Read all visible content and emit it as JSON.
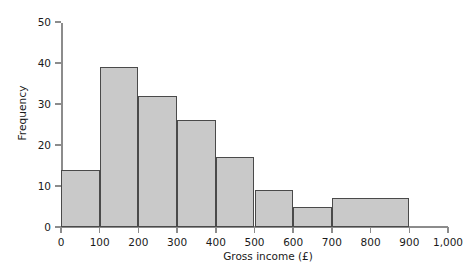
{
  "chart_data": {
    "type": "bar",
    "title": "",
    "subtitle": "",
    "xlabel": "Gross income (£)",
    "ylabel": "Frequency",
    "xlim": [
      0,
      1000
    ],
    "ylim": [
      0,
      55
    ],
    "grid": false,
    "legend": null,
    "x_tick_labels": [
      "0",
      "100",
      "200",
      "300",
      "400",
      "500",
      "600",
      "700",
      "800",
      "900",
      "1,000"
    ],
    "x_tick_values": [
      0,
      100,
      200,
      300,
      400,
      500,
      600,
      700,
      800,
      900,
      1000
    ],
    "y_tick_labels": [
      "0",
      "10",
      "20",
      "30",
      "40",
      "50"
    ],
    "y_tick_values": [
      0,
      10,
      20,
      30,
      40,
      50
    ],
    "bin_edges": [
      0,
      100,
      200,
      300,
      400,
      500,
      600,
      700,
      900
    ],
    "categories": [
      "0-100",
      "100-200",
      "200-300",
      "300-400",
      "400-500",
      "500-600",
      "600-700",
      "700-900"
    ],
    "values": [
      14,
      39,
      32,
      26,
      17,
      9,
      5,
      7
    ],
    "bars": [
      {
        "label": "0-100",
        "start": 0,
        "end": 100,
        "value": 14
      },
      {
        "label": "100-200",
        "start": 100,
        "end": 200,
        "value": 39
      },
      {
        "label": "200-300",
        "start": 200,
        "end": 300,
        "value": 32
      },
      {
        "label": "300-400",
        "start": 300,
        "end": 400,
        "value": 26
      },
      {
        "label": "400-500",
        "start": 400,
        "end": 500,
        "value": 17
      },
      {
        "label": "500-600",
        "start": 500,
        "end": 600,
        "value": 9
      },
      {
        "label": "600-700",
        "start": 600,
        "end": 700,
        "value": 5
      },
      {
        "label": "700-900",
        "start": 700,
        "end": 900,
        "value": 7
      }
    ],
    "colors": {
      "bar_fill": "#c9c9c9",
      "bar_border": "#4a4a4a",
      "axis": "#8c8c8c",
      "text": "#1a1a1a",
      "background": "#ffffff"
    }
  }
}
